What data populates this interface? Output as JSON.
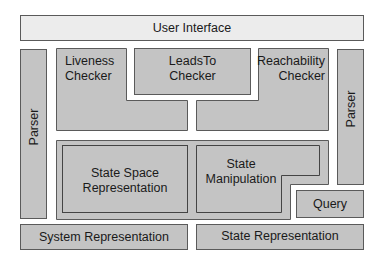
{
  "diagram": {
    "user_interface": "User Interface",
    "parser_left": "Parser",
    "parser_right": "Parser",
    "liveness": [
      "Liveness",
      "Checker"
    ],
    "leadsto": [
      "LeadsTo",
      "Checker"
    ],
    "reachability": [
      "Reachability",
      "Checker"
    ],
    "state_space": [
      "State Space",
      "Representation"
    ],
    "state_manipulation": [
      "State",
      "Manipulation"
    ],
    "query": "Query",
    "system_representation": "System Representation",
    "state_representation": "State Representation"
  },
  "colors": {
    "fill": "#c4c4c4",
    "light_fill": "#ececec",
    "border": "#5a5a5a"
  }
}
